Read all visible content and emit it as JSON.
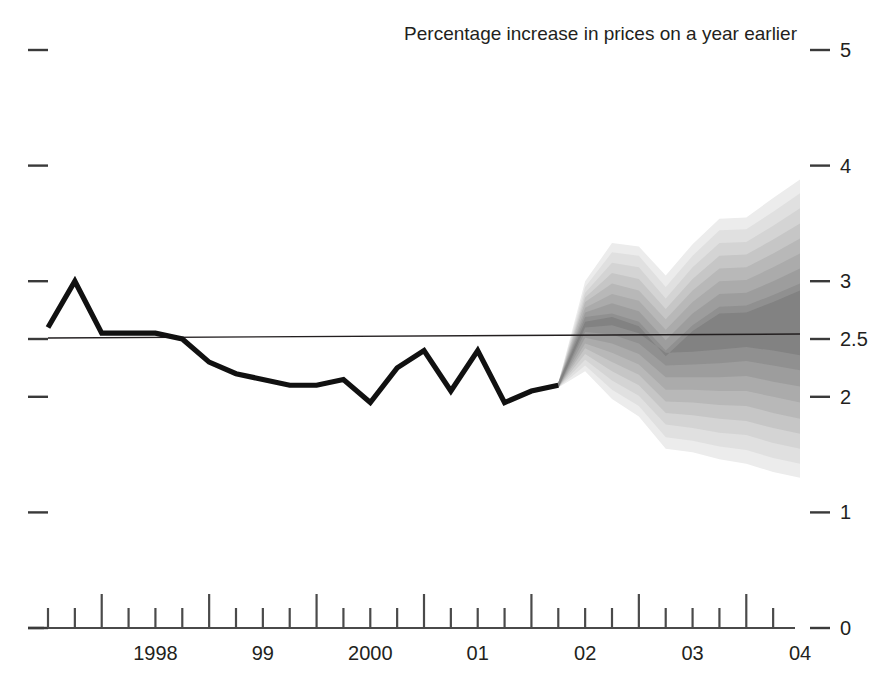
{
  "chart_data": {
    "type": "area",
    "title": "Percentage increase in prices on a year earlier",
    "subtitle": "",
    "xlabel": "",
    "ylabel": "",
    "ylim": [
      0,
      5
    ],
    "xlim": [
      1997.5,
      2004.5
    ],
    "grid": false,
    "legend": "none",
    "y_ticks": [
      "5",
      "4",
      "3",
      "2.5",
      "2",
      "1",
      "0"
    ],
    "y_tick_values": [
      5,
      4,
      3,
      2.5,
      2,
      1,
      0
    ],
    "x_ticks": [
      "1998",
      "99",
      "2000",
      "01",
      "02",
      "03",
      "04"
    ],
    "x_tick_values": [
      1998,
      1999,
      2000,
      2001,
      2002,
      2003,
      2004
    ],
    "target_line_value": 2.5,
    "forecast_start": 2002.25,
    "series": [
      {
        "name": "Historical inflation (RPIX)",
        "type": "line",
        "x": [
          1997.5,
          1997.75,
          1998.0,
          1998.25,
          1998.5,
          1998.75,
          1999.0,
          1999.25,
          1999.5,
          1999.75,
          2000.0,
          2000.25,
          2000.5,
          2000.75,
          2001.0,
          2001.25,
          2001.5,
          2001.75,
          2002.0,
          2002.25
        ],
        "values": [
          2.6,
          3.0,
          2.55,
          2.55,
          2.55,
          2.5,
          2.3,
          2.2,
          2.15,
          2.1,
          2.1,
          2.15,
          1.95,
          2.25,
          2.4,
          2.05,
          2.4,
          1.95,
          2.05,
          2.1
        ]
      },
      {
        "name": "Forecast central projection",
        "type": "line",
        "x": [
          2002.25,
          2002.5,
          2002.75,
          2003.0,
          2003.25,
          2003.5,
          2003.75,
          2004.0,
          2004.25,
          2004.5
        ],
        "values": [
          2.1,
          2.62,
          2.66,
          2.58,
          2.3,
          2.3,
          2.35,
          2.45,
          2.5,
          2.52
        ]
      }
    ],
    "fan_bands": [
      {
        "name": "90% band",
        "shade": "#ececec",
        "upper": [
          2.12,
          3.0,
          3.33,
          3.3,
          3.05,
          3.32,
          3.54,
          3.55,
          3.72,
          3.88
        ],
        "lower": [
          2.08,
          2.22,
          1.98,
          1.83,
          1.55,
          1.52,
          1.46,
          1.42,
          1.35,
          1.3
        ]
      },
      {
        "name": "80% band",
        "shade": "#e0e0e0",
        "upper": [
          2.12,
          2.95,
          3.25,
          3.22,
          2.95,
          3.22,
          3.44,
          3.45,
          3.6,
          3.76
        ],
        "lower": [
          2.08,
          2.27,
          2.06,
          1.92,
          1.65,
          1.62,
          1.57,
          1.54,
          1.47,
          1.42
        ]
      },
      {
        "name": "70% band",
        "shade": "#d4d4d4",
        "upper": [
          2.12,
          2.9,
          3.16,
          3.12,
          2.85,
          3.12,
          3.33,
          3.34,
          3.48,
          3.63
        ],
        "lower": [
          2.08,
          2.32,
          2.14,
          2.01,
          1.76,
          1.73,
          1.69,
          1.67,
          1.6,
          1.55
        ]
      },
      {
        "name": "60% band",
        "shade": "#c6c6c6",
        "upper": [
          2.12,
          2.86,
          3.07,
          3.02,
          2.76,
          3.02,
          3.22,
          3.23,
          3.36,
          3.5
        ],
        "lower": [
          2.08,
          2.37,
          2.22,
          2.1,
          1.86,
          1.84,
          1.81,
          1.79,
          1.73,
          1.68
        ]
      },
      {
        "name": "50% band",
        "shade": "#b8b8b8",
        "upper": [
          2.12,
          2.82,
          2.98,
          2.92,
          2.67,
          2.92,
          3.11,
          3.12,
          3.24,
          3.37
        ],
        "lower": [
          2.08,
          2.42,
          2.3,
          2.19,
          1.96,
          1.95,
          1.93,
          1.92,
          1.86,
          1.81
        ]
      },
      {
        "name": "40% band",
        "shade": "#ababab",
        "upper": [
          2.12,
          2.77,
          2.89,
          2.83,
          2.58,
          2.82,
          3.0,
          3.01,
          3.12,
          3.24
        ],
        "lower": [
          2.08,
          2.46,
          2.38,
          2.28,
          2.06,
          2.06,
          2.05,
          2.05,
          2.0,
          1.95
        ]
      },
      {
        "name": "30% band",
        "shade": "#9d9d9d",
        "upper": [
          2.12,
          2.73,
          2.81,
          2.74,
          2.49,
          2.72,
          2.89,
          2.9,
          3.0,
          3.11
        ],
        "lower": [
          2.08,
          2.51,
          2.46,
          2.37,
          2.17,
          2.17,
          2.17,
          2.18,
          2.13,
          2.09
        ]
      },
      {
        "name": "20% band",
        "shade": "#909090",
        "upper": [
          2.12,
          2.69,
          2.72,
          2.65,
          2.4,
          2.62,
          2.78,
          2.79,
          2.88,
          2.98
        ],
        "lower": [
          2.08,
          2.56,
          2.54,
          2.46,
          2.27,
          2.28,
          2.29,
          2.31,
          2.27,
          2.23
        ]
      },
      {
        "name": "10% band",
        "shade": "#828282",
        "upper": [
          2.12,
          2.65,
          2.69,
          2.61,
          2.35,
          2.57,
          2.72,
          2.73,
          2.82,
          2.92
        ],
        "lower": [
          2.08,
          2.6,
          2.62,
          2.55,
          2.38,
          2.39,
          2.41,
          2.43,
          2.4,
          2.36
        ]
      }
    ]
  },
  "axes": {
    "title": "Percentage increase in prices on a year earlier",
    "right_labels": [
      "5",
      "4",
      "3",
      "2.5",
      "2",
      "1",
      "0"
    ],
    "x_labels": [
      "1998",
      "99",
      "2000",
      "01",
      "02",
      "03",
      "04"
    ]
  }
}
